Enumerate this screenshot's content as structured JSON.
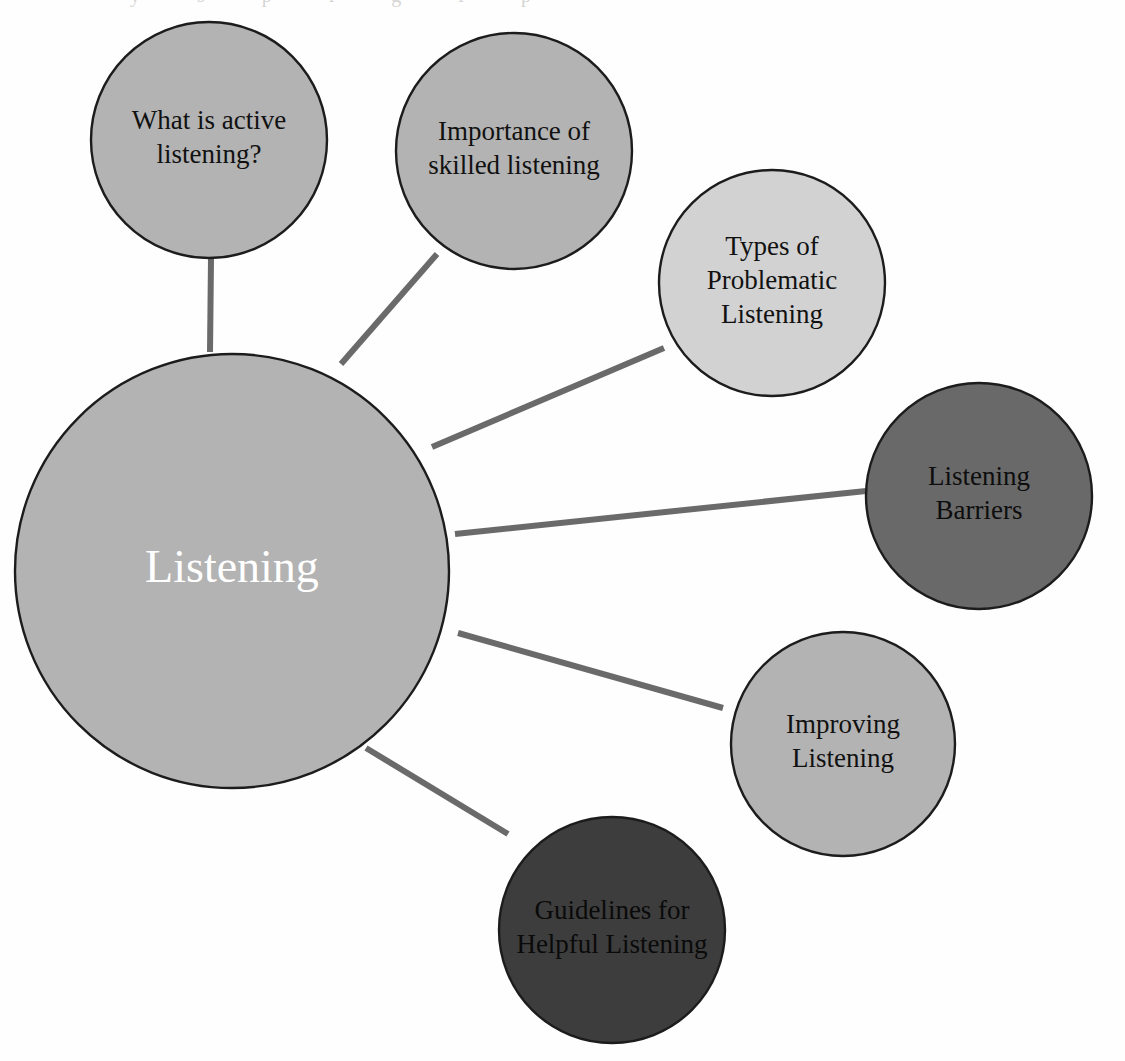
{
  "diagram": {
    "title": "Listening",
    "type": "mind-map",
    "background_color": "#fefefe",
    "connector_color": "#6a6a6a",
    "outline_color": "#1c1c1c"
  },
  "center_node": {
    "id": "listening",
    "label": "Listening",
    "cx": 232,
    "cy": 571,
    "r": 217,
    "fill": "#b3b3b3",
    "text_color": "#ffffff",
    "font_size": 46,
    "lines": [
      "Listening"
    ]
  },
  "nodes": [
    {
      "id": "what-is-active-listening",
      "label": "What is active listening?",
      "lines": [
        "What is active",
        "listening?"
      ],
      "cx": 209,
      "cy": 140,
      "r": 118,
      "fill": "#b3b3b3",
      "text_color": "#111111",
      "font_size": 27
    },
    {
      "id": "importance-of-skilled-listening",
      "label": "Importance of skilled listening",
      "lines": [
        "Importance of",
        "skilled listening"
      ],
      "cx": 514,
      "cy": 151,
      "r": 118,
      "fill": "#b3b3b3",
      "text_color": "#111111",
      "font_size": 27
    },
    {
      "id": "types-of-problematic-listening",
      "label": "Types of Problematic Listening",
      "lines": [
        "Types of",
        "Problematic",
        "Listening"
      ],
      "cx": 772,
      "cy": 283,
      "r": 113,
      "fill": "#d2d2d2",
      "text_color": "#111111",
      "font_size": 27
    },
    {
      "id": "listening-barriers",
      "label": "Listening Barriers",
      "lines": [
        "Listening",
        "Barriers"
      ],
      "cx": 979,
      "cy": 496,
      "r": 113,
      "fill": "#696969",
      "text_color": "#0d0d0d",
      "font_size": 27
    },
    {
      "id": "improving-listening",
      "label": "Improving Listening",
      "lines": [
        "Improving",
        "Listening"
      ],
      "cx": 843,
      "cy": 744,
      "r": 112,
      "fill": "#b3b3b3",
      "text_color": "#111111",
      "font_size": 27
    },
    {
      "id": "guidelines-for-helpful-listening",
      "label": "Guidelines for Helpful Listening",
      "lines": [
        "Guidelines for",
        "Helpful Listening"
      ],
      "cx": 612,
      "cy": 930,
      "r": 113,
      "fill": "#3d3d3d",
      "text_color": "#0a0a0a",
      "font_size": 27
    }
  ],
  "connectors": [
    {
      "id": "connector-to-what-is-active-listening",
      "from": "listening",
      "to": "what-is-active-listening",
      "x1": 210,
      "y1": 352,
      "x2": 211,
      "y2": 259,
      "width": 6
    },
    {
      "id": "connector-to-importance-of-skilled-listening",
      "from": "listening",
      "to": "importance-of-skilled-listening",
      "x1": 341,
      "y1": 364,
      "x2": 437,
      "y2": 254,
      "width": 6
    },
    {
      "id": "connector-to-types-of-problematic-listening",
      "from": "listening",
      "to": "types-of-problematic-listening",
      "x1": 432,
      "y1": 447,
      "x2": 664,
      "y2": 348,
      "width": 6
    },
    {
      "id": "connector-to-listening-barriers",
      "from": "listening",
      "to": "listening-barriers",
      "x1": 455,
      "y1": 534,
      "x2": 866,
      "y2": 491,
      "width": 6
    },
    {
      "id": "connector-to-improving-listening",
      "from": "listening",
      "to": "improving-listening",
      "x1": 458,
      "y1": 633,
      "x2": 723,
      "y2": 708,
      "width": 6
    },
    {
      "id": "connector-to-guidelines-for-helpful-listening",
      "from": "listening",
      "to": "guidelines-for-helpful-listening",
      "x1": 366,
      "y1": 748,
      "x2": 508,
      "y2": 834,
      "width": 6
    }
  ],
  "artifacts": {
    "top_edge_text_fragment": "y  s p   l   g   l  p"
  }
}
